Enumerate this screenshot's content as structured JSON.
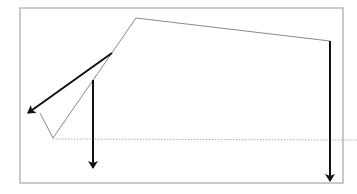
{
  "diagram": {
    "colors": {
      "frame": "#b8b8b8",
      "polyline": "#8a8a8a",
      "baseline": "#b0b0b0",
      "arrow": "#111111"
    },
    "frame": {
      "x": 20,
      "y": 8,
      "width": 323,
      "height": 175
    },
    "polyline": {
      "points": [
        [
          40,
          113
        ],
        [
          53,
          138
        ],
        [
          136,
          18
        ],
        [
          330,
          41
        ]
      ]
    },
    "baseline": {
      "x1": 53,
      "y1": 139,
      "x2": 357,
      "y2": 140
    },
    "arrows": [
      {
        "name": "left-diagonal-arrow",
        "from": [
          112,
          53
        ],
        "to": [
          28,
          113
        ]
      },
      {
        "name": "middle-vertical-arrow",
        "from": [
          93,
          80
        ],
        "to": [
          93,
          168
        ]
      },
      {
        "name": "right-vertical-arrow",
        "from": [
          330,
          41
        ],
        "to": [
          330,
          181
        ]
      }
    ]
  }
}
